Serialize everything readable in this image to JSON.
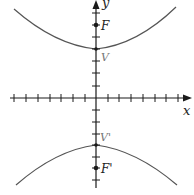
{
  "figure": {
    "type": "hyperbola",
    "axes": {
      "x_label": "x",
      "y_label": "y"
    },
    "points": {
      "focus_upper": {
        "label": "F",
        "y_units": 6
      },
      "vertex_upper": {
        "label": "V",
        "y_units": 4
      },
      "vertex_lower": {
        "label": "V'",
        "y_units": -4
      },
      "focus_lower": {
        "label": "F'",
        "y_units": -6
      }
    },
    "ticks": {
      "x_left_count": 7,
      "x_right_count": 7,
      "y_upper_count": 7,
      "y_lower_count": 7
    },
    "colors": {
      "axis": "#1a1a1a",
      "curve": "#555555",
      "focus_label": "#222222",
      "vertex_label": "#777777",
      "background": "#ffffff"
    }
  }
}
